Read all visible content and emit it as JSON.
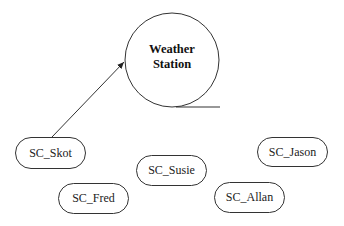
{
  "diagram": {
    "station": {
      "line1": "Weather",
      "line2": "Station"
    },
    "nodes": [
      {
        "id": "skot",
        "label": "SC_Skot"
      },
      {
        "id": "fred",
        "label": "SC_Fred"
      },
      {
        "id": "susie",
        "label": "SC_Susie"
      },
      {
        "id": "jason",
        "label": "SC_Jason"
      },
      {
        "id": "allan",
        "label": "SC_Allan"
      }
    ],
    "edges": [
      {
        "from": "SC_Skot",
        "to": "Weather Station",
        "type": "arrow"
      }
    ],
    "colors": {
      "stroke": "#333333",
      "background": "#ffffff",
      "text": "#222222"
    }
  }
}
